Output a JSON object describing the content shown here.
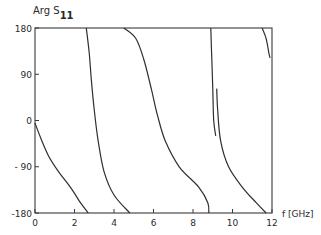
{
  "chart_data": {
    "type": "line",
    "title": "",
    "ylabel": "Arg S",
    "ylabel_subscript": "11",
    "xlabel": "f [GHz]",
    "xlim": [
      0,
      12
    ],
    "ylim": [
      -180,
      180
    ],
    "xticks": [
      0,
      2,
      4,
      6,
      8,
      10,
      12
    ],
    "yticks": [
      180,
      90,
      0,
      -90,
      -180
    ],
    "xtick_labels": [
      "0",
      "2",
      "4",
      "6",
      "8",
      "10",
      "12"
    ],
    "ytick_labels": [
      "180",
      "90",
      "0",
      "- 90",
      "-180"
    ],
    "grid": false,
    "legend": null,
    "series": [
      {
        "name": "branch-1",
        "points": [
          [
            0.0,
            -5
          ],
          [
            0.3,
            -35
          ],
          [
            0.7,
            -70
          ],
          [
            1.2,
            -100
          ],
          [
            1.8,
            -130
          ],
          [
            2.3,
            -160
          ],
          [
            2.7,
            -180
          ]
        ]
      },
      {
        "name": "branch-2",
        "points": [
          [
            2.6,
            180
          ],
          [
            2.75,
            130
          ],
          [
            2.85,
            80
          ],
          [
            3.0,
            20
          ],
          [
            3.2,
            -40
          ],
          [
            3.5,
            -100
          ],
          [
            4.0,
            -145
          ],
          [
            4.8,
            -180
          ]
        ]
      },
      {
        "name": "branch-3",
        "points": [
          [
            4.5,
            180
          ],
          [
            5.1,
            160
          ],
          [
            5.5,
            120
          ],
          [
            5.9,
            60
          ],
          [
            6.2,
            10
          ],
          [
            6.6,
            -40
          ],
          [
            7.3,
            -90
          ],
          [
            8.3,
            -130
          ],
          [
            8.75,
            -160
          ],
          [
            8.8,
            -180
          ]
        ]
      },
      {
        "name": "branch-4",
        "points": [
          [
            8.9,
            180
          ],
          [
            8.95,
            120
          ],
          [
            9.0,
            60
          ],
          [
            9.05,
            0
          ],
          [
            9.15,
            -30
          ]
        ]
      },
      {
        "name": "branch-5",
        "points": [
          [
            9.2,
            62
          ],
          [
            9.25,
            20
          ],
          [
            9.4,
            -40
          ],
          [
            9.8,
            -90
          ],
          [
            10.5,
            -130
          ],
          [
            11.2,
            -160
          ],
          [
            11.7,
            -180
          ]
        ]
      },
      {
        "name": "branch-6",
        "points": [
          [
            11.5,
            180
          ],
          [
            11.7,
            160
          ],
          [
            11.85,
            130
          ],
          [
            11.9,
            122
          ]
        ]
      }
    ]
  }
}
